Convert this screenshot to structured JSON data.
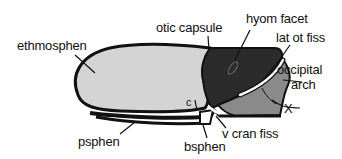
{
  "diagram": {
    "colors": {
      "ethmosphen_fill": "#d4d4d4",
      "otic_capsule_fill": "#2b2b2b",
      "occipital_arch_fill": "#8a8a8a",
      "outline": "#111111",
      "fissure": "#ffffff",
      "background": "#ffffff"
    },
    "labels": {
      "ethmosphen": "ethmosphen",
      "otic_capsule": "otic capsule",
      "hyom_facet": "hyom facet",
      "lat_ot_fiss": "lat ot fiss",
      "occipital_arch_line1": "occipital",
      "occipital_arch_line2": "arch",
      "x": "X",
      "v_cran_fiss": "v cran fiss",
      "psphen": "psphen",
      "bsphen": "bsphen",
      "c": "c"
    }
  }
}
